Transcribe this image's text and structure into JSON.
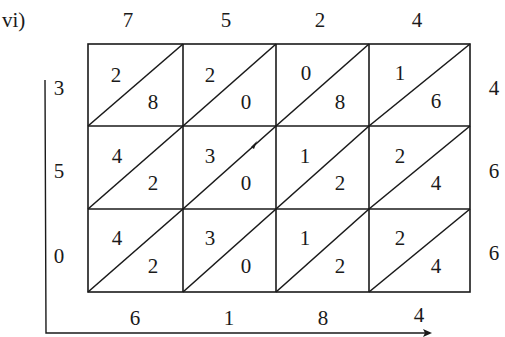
{
  "label": "vi)",
  "multiplicand_digits": [
    "7",
    "5",
    "2",
    "4"
  ],
  "multiplier_digits": [
    "4",
    "6",
    "6"
  ],
  "left_result_digits": [
    "3",
    "5",
    "0"
  ],
  "bottom_result_digits": [
    "6",
    "1",
    "8",
    "4"
  ],
  "cells": [
    [
      {
        "tens": "2",
        "ones": "8"
      },
      {
        "tens": "2",
        "ones": "0"
      },
      {
        "tens": "0",
        "ones": "8"
      },
      {
        "tens": "1",
        "ones": "6"
      }
    ],
    [
      {
        "tens": "4",
        "ones": "2"
      },
      {
        "tens": "3",
        "ones": "0"
      },
      {
        "tens": "1",
        "ones": "2"
      },
      {
        "tens": "2",
        "ones": "4"
      }
    ],
    [
      {
        "tens": "4",
        "ones": "2"
      },
      {
        "tens": "3",
        "ones": "0"
      },
      {
        "tens": "1",
        "ones": "2"
      },
      {
        "tens": "2",
        "ones": "4"
      }
    ]
  ],
  "colors": {
    "ink": "#1a1a1a",
    "background": "#ffffff"
  }
}
